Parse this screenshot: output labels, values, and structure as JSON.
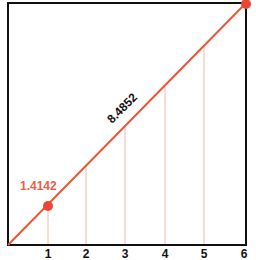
{
  "diagram": {
    "colors": {
      "line": "#ee5533",
      "point": "#ee4433",
      "frame": "#111111",
      "guide": "#f2b8ad",
      "label_small": "#e8604a",
      "label_diag": "#111111"
    },
    "frame": {
      "x0": 8,
      "y0": 3,
      "x1": 246,
      "y1": 245
    },
    "x_ticks": [
      "1",
      "2",
      "3",
      "4",
      "5",
      "6"
    ],
    "x_tick_positions": [
      48,
      86,
      125,
      165,
      204,
      244
    ],
    "points": [
      {
        "x": 1,
        "y": 1,
        "label": "1.4142"
      },
      {
        "x": 6,
        "y": 6
      }
    ],
    "diagonal_label": "8.4852",
    "small_label": "1.4142"
  }
}
